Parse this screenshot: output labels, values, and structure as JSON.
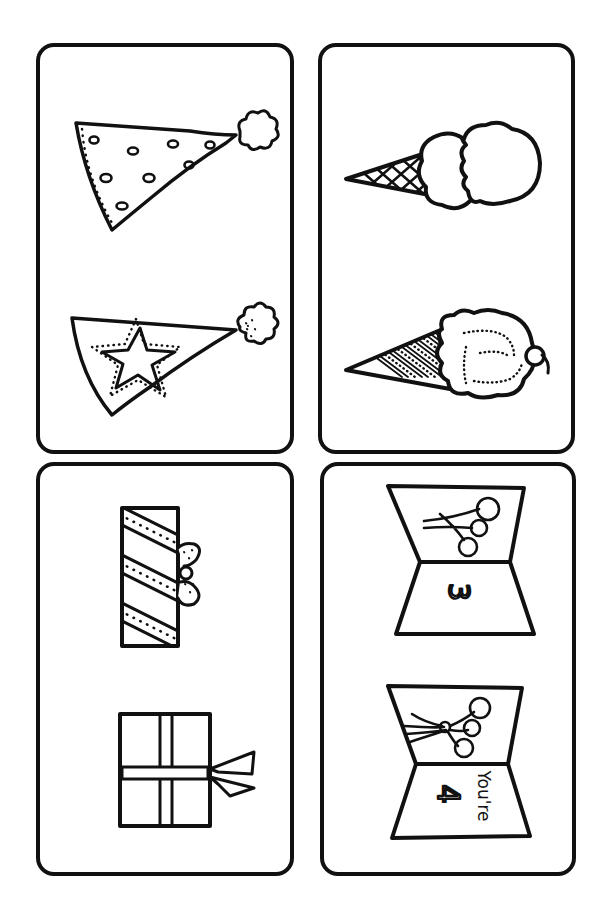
{
  "page": {
    "background": "#ffffff",
    "ink": "#111111"
  },
  "cards": [
    {
      "id": "party-hats",
      "items": [
        {
          "name": "polka-dot-party-hat",
          "pattern": "dots"
        },
        {
          "name": "star-party-hat",
          "pattern": "star"
        }
      ]
    },
    {
      "id": "ice-cream-cones",
      "items": [
        {
          "name": "double-scoop-waffle-cone",
          "pattern": "crosshatch"
        },
        {
          "name": "cherry-topped-cone",
          "pattern": "diagonal-stripes-dots"
        }
      ]
    },
    {
      "id": "gift-boxes",
      "items": [
        {
          "name": "striped-gift-with-bow",
          "pattern": "diagonal-stripes"
        },
        {
          "name": "ribbon-cross-gift",
          "pattern": "ribbon"
        }
      ]
    },
    {
      "id": "birthday-cards",
      "items": [
        {
          "name": "balloons-card-3",
          "number_text": "3"
        },
        {
          "name": "balloons-card-youre-4",
          "number_text": "4",
          "caption_text": "You're"
        }
      ]
    }
  ]
}
